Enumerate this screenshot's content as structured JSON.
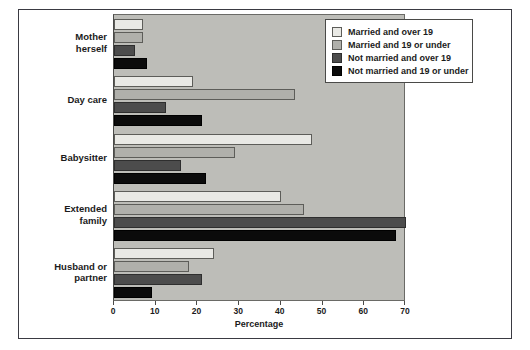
{
  "chart_data": {
    "type": "bar",
    "orientation": "horizontal",
    "title": "",
    "xlabel": "Percentage",
    "ylabel": "",
    "xlim": [
      0,
      70
    ],
    "xticks": [
      0,
      10,
      20,
      30,
      40,
      50,
      60,
      70
    ],
    "xtick_labels": [
      "0",
      "10",
      "20",
      "30",
      "40",
      "50",
      "60",
      "70"
    ],
    "grid": false,
    "legend_position": "top-right",
    "categories": [
      "Mother herself",
      "Day care",
      "Babysitter",
      "Extended family",
      "Husband or partner"
    ],
    "series": [
      {
        "name": "Married and over 19",
        "color": "#e9e9e5",
        "values": [
          7,
          19,
          47.5,
          40,
          24
        ]
      },
      {
        "name": "Married and 19 or under",
        "color": "#b0b0ab",
        "values": [
          7,
          43.5,
          29,
          45.5,
          18
        ]
      },
      {
        "name": "Not married and over 19",
        "color": "#4c4c4c",
        "values": [
          5,
          12.5,
          16,
          70,
          21
        ]
      },
      {
        "name": "Not married and 19 or under",
        "color": "#0b0b0b",
        "values": [
          8,
          21,
          22,
          67.5,
          9
        ]
      }
    ]
  },
  "legend": {
    "items": [
      "Married and over 19",
      "Married and 19 or under",
      "Not married and over 19",
      "Not married and 19 or under"
    ]
  },
  "axis": {
    "x_title": "Percentage"
  },
  "colors": {
    "plot_background": "#bdbdb8",
    "frame": "#3a3a42",
    "text": "#1b1b1b",
    "series_0": "#e9e9e5",
    "series_1": "#b0b0ab",
    "series_2": "#4c4c4c",
    "series_3": "#0b0b0b"
  }
}
